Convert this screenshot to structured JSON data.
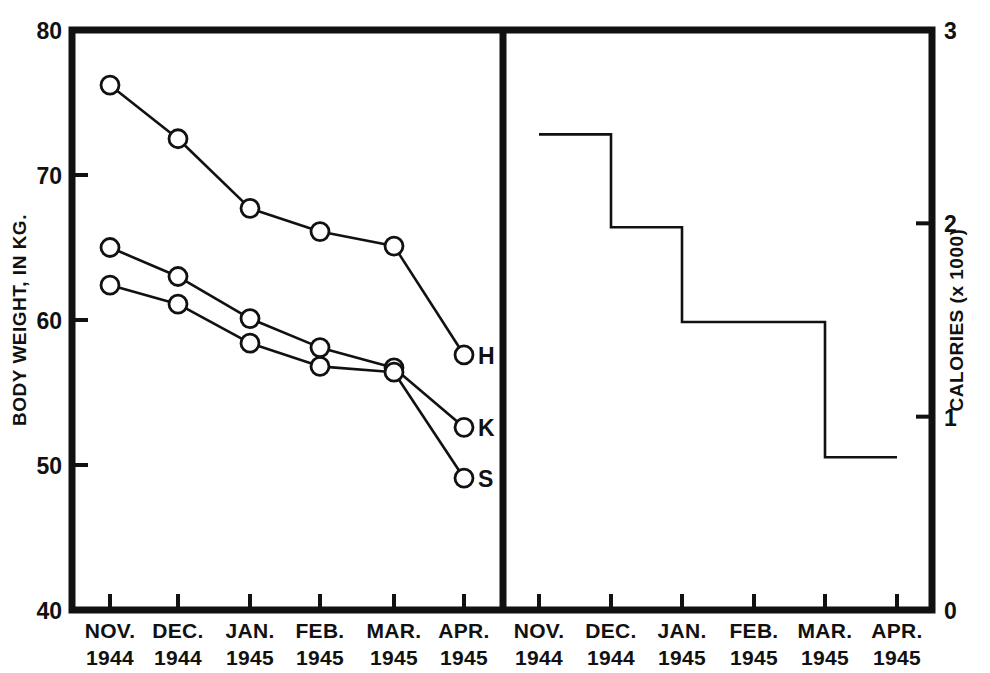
{
  "figure": {
    "background": "#ffffff",
    "ink_color": "#111111",
    "left_panel": {
      "name": "body-weight-panel",
      "y_axis_label": "BODY WEIGHT, IN KG.",
      "y_ticks": [
        "80",
        "70",
        "60",
        "50",
        "40"
      ],
      "y_tick_values": [
        80,
        70,
        60,
        50,
        40
      ],
      "x_tick_labels": [
        {
          "month": "NOV.",
          "year": "1944"
        },
        {
          "month": "DEC.",
          "year": "1944"
        },
        {
          "month": "JAN.",
          "year": "1945"
        },
        {
          "month": "FEB.",
          "year": "1945"
        },
        {
          "month": "MAR.",
          "year": "1945"
        },
        {
          "month": "APR.",
          "year": "1945"
        }
      ],
      "series_labels": [
        "H",
        "K",
        "S"
      ]
    },
    "right_panel": {
      "name": "calories-panel",
      "y_axis_label": "CALORIES (x 1000)",
      "y_ticks": [
        "3",
        "2",
        "1",
        "0"
      ],
      "y_tick_values": [
        3,
        2,
        1,
        0
      ],
      "x_tick_labels": [
        {
          "month": "NOV.",
          "year": "1944"
        },
        {
          "month": "DEC.",
          "year": "1944"
        },
        {
          "month": "JAN.",
          "year": "1945"
        },
        {
          "month": "FEB.",
          "year": "1945"
        },
        {
          "month": "MAR.",
          "year": "1945"
        },
        {
          "month": "APR.",
          "year": "1945"
        }
      ]
    }
  },
  "chart_data": [
    {
      "type": "line",
      "title": "",
      "xlabel": "",
      "ylabel": "BODY WEIGHT, IN KG.",
      "ylim": [
        40,
        80
      ],
      "ytick_step": 10,
      "grid": false,
      "legend": "inline-right-of-last-point",
      "marker": "open-circle",
      "categories": [
        "NOV. 1944",
        "DEC. 1944",
        "JAN. 1945",
        "FEB. 1945",
        "MAR. 1945",
        "APR. 1945"
      ],
      "series": [
        {
          "name": "H",
          "values": [
            76.2,
            72.5,
            67.7,
            66.1,
            65.1,
            57.6
          ]
        },
        {
          "name": "K",
          "values": [
            65.0,
            63.0,
            60.1,
            58.1,
            56.7,
            52.6
          ]
        },
        {
          "name": "S",
          "values": [
            62.4,
            61.1,
            58.4,
            56.8,
            56.4,
            49.1
          ]
        }
      ]
    },
    {
      "type": "line",
      "subtype": "step",
      "title": "",
      "xlabel": "",
      "ylabel": "CALORIES (x 1000)",
      "ylim": [
        0,
        3
      ],
      "ytick_step": 1,
      "grid": false,
      "categories": [
        "NOV. 1944",
        "DEC. 1944",
        "JAN. 1945",
        "FEB. 1945",
        "MAR. 1945",
        "APR. 1945"
      ],
      "series": [
        {
          "name": "Calories",
          "values": [
            2.46,
            1.98,
            1.49,
            1.49,
            0.79,
            0.79
          ]
        }
      ],
      "steps": [
        {
          "from": "NOV. 1944",
          "to": "DEC. 1944",
          "value": 2.46
        },
        {
          "from": "DEC. 1944",
          "to": "JAN. 1945",
          "value": 1.98
        },
        {
          "from": "JAN. 1945",
          "to": "MAR. 1945",
          "value": 1.49
        },
        {
          "from": "MAR. 1945",
          "to": "APR. 1945",
          "value": 0.79
        }
      ]
    }
  ]
}
